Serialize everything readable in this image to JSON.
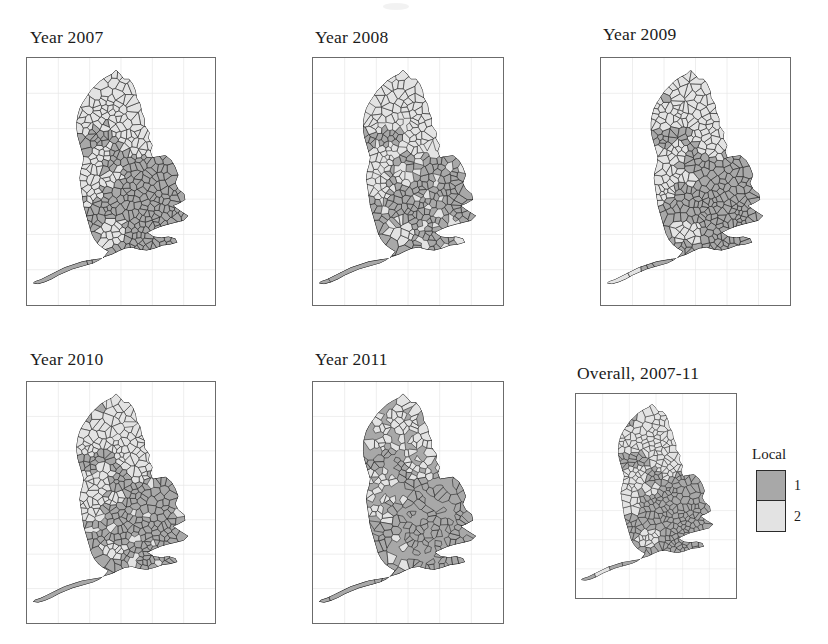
{
  "figure": {
    "background_color": "#ffffff"
  },
  "legend": {
    "title": "Local",
    "entries": [
      {
        "label": "1",
        "color": "#a8a8a8"
      },
      {
        "label": "2",
        "color": "#e3e3e3"
      }
    ]
  },
  "panels": [
    {
      "id": "panel-2007",
      "title": "Year 2007"
    },
    {
      "id": "panel-2008",
      "title": "Year 2008"
    },
    {
      "id": "panel-2009",
      "title": "Year 2009"
    },
    {
      "id": "panel-2010",
      "title": "Year 2010"
    },
    {
      "id": "panel-2011",
      "title": "Year 2011"
    },
    {
      "id": "panel-overall",
      "title": "Overall, 2007-11"
    }
  ],
  "chart_data": {
    "type": "heatmap",
    "title": "",
    "subtitle": "",
    "xlabel": "",
    "ylabel": "",
    "grid": true,
    "legend_position": "right",
    "map_region": "England",
    "geography_unit": "Local authority district",
    "categories": [
      "1",
      "2"
    ],
    "category_colors": [
      "#a8a8a8",
      "#e3e3e3"
    ],
    "legend_title": "Local",
    "panel_labels": [
      "Year 2007",
      "Year 2008",
      "Year 2009",
      "Year 2010",
      "Year 2011",
      "Overall, 2007-11"
    ],
    "series": [
      {
        "name": "Year 2007",
        "categories": [
          "1",
          "2"
        ],
        "values": [
          1,
          2
        ]
      },
      {
        "name": "Year 2008",
        "categories": [
          "1",
          "2"
        ],
        "values": [
          1,
          2
        ]
      },
      {
        "name": "Year 2009",
        "categories": [
          "1",
          "2"
        ],
        "values": [
          1,
          2
        ]
      },
      {
        "name": "Year 2010",
        "categories": [
          "1",
          "2"
        ],
        "values": [
          1,
          2
        ]
      },
      {
        "name": "Year 2011",
        "categories": [
          "1",
          "2"
        ],
        "values": [
          1,
          2
        ]
      },
      {
        "name": "Overall, 2007-11",
        "categories": [
          "1",
          "2"
        ],
        "values": [
          1,
          2
        ]
      }
    ]
  }
}
